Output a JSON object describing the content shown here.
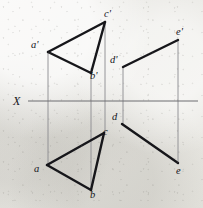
{
  "figure": {
    "axis": {
      "label": "X",
      "label_x": 13,
      "label_y": 95,
      "y": 101,
      "x_start": 28,
      "x_end": 198,
      "color": "#6d6d70"
    },
    "ink_color": "#16161a",
    "projector_color": "#8b8b8e",
    "points": [
      {
        "id": "a-prime",
        "label": "a'",
        "x": 48,
        "y": 52,
        "label_x": 31,
        "label_y": 40
      },
      {
        "id": "b-prime",
        "label": "b'",
        "x": 91,
        "y": 73,
        "label_x": 90,
        "label_y": 71
      },
      {
        "id": "c-prime",
        "label": "c'",
        "x": 105,
        "y": 22,
        "label_x": 104,
        "label_y": 9
      },
      {
        "id": "a",
        "label": "a",
        "x": 47,
        "y": 165,
        "label_x": 34,
        "label_y": 164
      },
      {
        "id": "b",
        "label": "b",
        "x": 91,
        "y": 190,
        "label_x": 90,
        "label_y": 190
      },
      {
        "id": "c",
        "label": "c",
        "x": 104,
        "y": 133,
        "label_x": 103,
        "label_y": 127
      },
      {
        "id": "d-prime",
        "label": "d'",
        "x": 123,
        "y": 67,
        "label_x": 110,
        "label_y": 55
      },
      {
        "id": "e-prime",
        "label": "e'",
        "x": 178,
        "y": 40,
        "label_x": 176,
        "label_y": 27
      },
      {
        "id": "d",
        "label": "d",
        "x": 122,
        "y": 124,
        "label_x": 112,
        "label_y": 112
      },
      {
        "id": "e",
        "label": "e",
        "x": 178,
        "y": 163,
        "label_x": 176,
        "label_y": 166
      }
    ],
    "edges": [
      {
        "id": "edge-ap-cp",
        "from": "a-prime",
        "to": "c-prime"
      },
      {
        "id": "edge-cp-bp",
        "from": "c-prime",
        "to": "b-prime"
      },
      {
        "id": "edge-bp-ap",
        "from": "b-prime",
        "to": "a-prime"
      },
      {
        "id": "edge-a-c",
        "from": "a",
        "to": "c"
      },
      {
        "id": "edge-c-b",
        "from": "c",
        "to": "b"
      },
      {
        "id": "edge-b-a",
        "from": "b",
        "to": "a"
      },
      {
        "id": "edge-dp-ep",
        "from": "d-prime",
        "to": "e-prime"
      },
      {
        "id": "edge-d-e",
        "from": "d",
        "to": "e"
      }
    ],
    "projectors": [
      {
        "id": "projector-a",
        "x": 48,
        "y1": 52,
        "y2": 165
      },
      {
        "id": "projector-b",
        "x": 91,
        "y1": 73,
        "y2": 190
      },
      {
        "id": "projector-c",
        "x": 105,
        "y1": 22,
        "y2": 133
      },
      {
        "id": "projector-d",
        "x": 123,
        "y1": 67,
        "y2": 124
      },
      {
        "id": "projector-e",
        "x": 178,
        "y1": 40,
        "y2": 163
      }
    ]
  }
}
